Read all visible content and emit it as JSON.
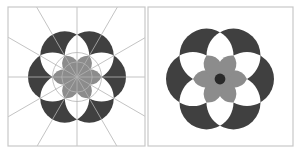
{
  "figure": {
    "panels": [
      {
        "name": "construction",
        "frame": {
          "x": 8,
          "y": 7,
          "w": 137,
          "h": 139
        },
        "center": {
          "x": 77,
          "y": 77
        },
        "radius": 24.5,
        "show_guides": true,
        "center_dot": false
      },
      {
        "name": "final",
        "frame": {
          "x": 148,
          "y": 7,
          "w": 145,
          "h": 139
        },
        "center": {
          "x": 220,
          "y": 79
        },
        "radius": 27,
        "show_guides": false,
        "center_dot": true
      }
    ],
    "colors": {
      "background": "#ffffff",
      "frame": "#c8c8c8",
      "dark_fill": "#404040",
      "petal_fill": "#8c8c8c",
      "guide": "#b4b4b4",
      "center_dot": "#2a2a2a"
    }
  }
}
